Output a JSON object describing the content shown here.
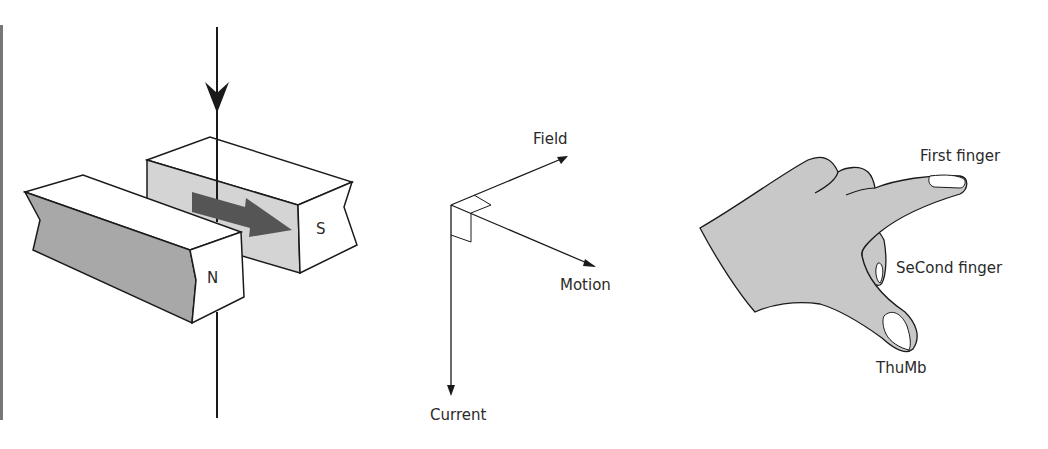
{
  "figure": {
    "panels": [
      {
        "id": "magnets",
        "description": "Conductor between N and S poles of two bar magnets with current arrow and motion arrow",
        "labels": {
          "north_pole": "N",
          "south_pole": "S"
        }
      },
      {
        "id": "vectors",
        "description": "Three mutually perpendicular vectors",
        "labels": {
          "field": "Field",
          "motion": "Motion",
          "current": "Current"
        }
      },
      {
        "id": "left-hand",
        "description": "Fleming's left-hand rule hand illustration",
        "labels": {
          "first_finger": "First finger",
          "second_finger": "SeCond finger",
          "thumb": "ThuMb"
        }
      }
    ]
  },
  "colors": {
    "stroke": "#1a1a1a",
    "magnet_top": "#ffffff",
    "magnet_front_dark": "#a8a8a8",
    "magnet_front_light": "#d4d4d4",
    "motion_arrow": "#555555",
    "hand_fill": "#c8c8c8",
    "left_bar": "#777777"
  }
}
